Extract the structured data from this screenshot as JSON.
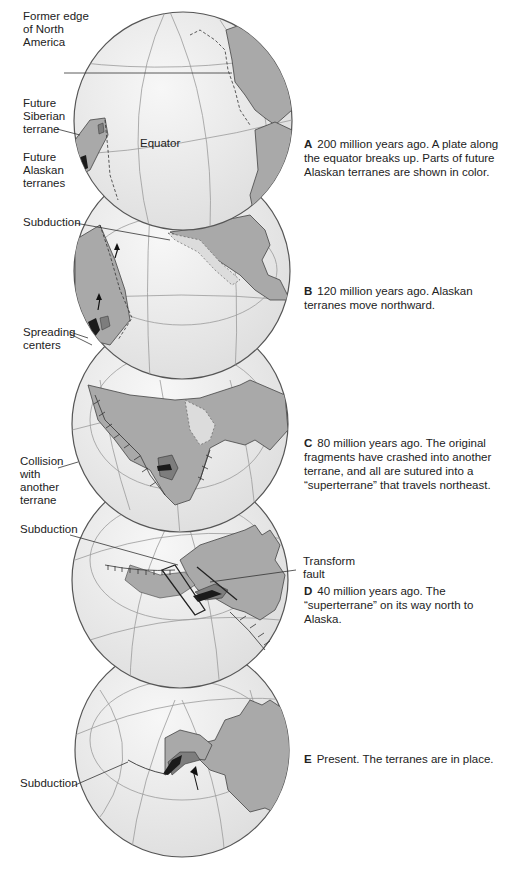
{
  "figure": {
    "colors": {
      "ocean": "#ececec",
      "land": "#a9a9a9",
      "terrane_dark": "#1a1a1a",
      "terrane_mid": "#7d7d7d",
      "outline": "#555555",
      "grid": "#9a9a9a"
    },
    "panels": [
      {
        "id": "A",
        "letter": "A",
        "caption": "200 million years ago.  A plate along the equator breaks up. Parts of future Alaskan terranes are shown in color.",
        "labels": [
          {
            "text": "Former edge\nof North\nAmerica"
          },
          {
            "text": "Future\nSiberian\nterrane"
          },
          {
            "text": "Future\nAlaskan\nterranes"
          },
          {
            "text": "Equator"
          }
        ]
      },
      {
        "id": "B",
        "letter": "B",
        "caption": "120 million years ago. Alaskan terranes move northward.",
        "labels": [
          {
            "text": "Subduction"
          },
          {
            "text": "Spreading\ncenters"
          }
        ]
      },
      {
        "id": "C",
        "letter": "C",
        "caption": "80 million years ago. The original fragments have crashed into another terrane, and all are sutured into a “superterrane” that travels northeast.",
        "labels": [
          {
            "text": "Collision\nwith\nanother\nterrane"
          }
        ]
      },
      {
        "id": "D",
        "letter": "D",
        "caption": "40 million years ago. The “superterrane” on its way north to Alaska.",
        "labels": [
          {
            "text": "Subduction"
          },
          {
            "text": "Transform\nfault"
          }
        ]
      },
      {
        "id": "E",
        "letter": "E",
        "caption": "Present. The terranes are in place.",
        "labels": [
          {
            "text": "Subduction"
          }
        ]
      }
    ]
  }
}
